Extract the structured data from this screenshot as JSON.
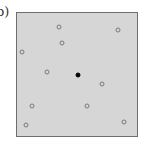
{
  "figure": {
    "panel_label": "b)",
    "box": {
      "background": "#d6d6d6",
      "border": "#6e6e6e"
    },
    "points": [
      {
        "x": 59,
        "y": 27,
        "type": "hollow"
      },
      {
        "x": 62,
        "y": 43,
        "type": "hollow"
      },
      {
        "x": 118,
        "y": 30,
        "type": "hollow"
      },
      {
        "x": 22,
        "y": 52,
        "type": "hollow"
      },
      {
        "x": 47,
        "y": 72,
        "type": "hollow"
      },
      {
        "x": 102,
        "y": 84,
        "type": "hollow"
      },
      {
        "x": 32,
        "y": 106,
        "type": "hollow"
      },
      {
        "x": 87,
        "y": 106,
        "type": "hollow"
      },
      {
        "x": 26,
        "y": 125,
        "type": "hollow"
      },
      {
        "x": 124,
        "y": 122,
        "type": "hollow"
      },
      {
        "x": 78,
        "y": 75,
        "type": "filled"
      }
    ]
  }
}
